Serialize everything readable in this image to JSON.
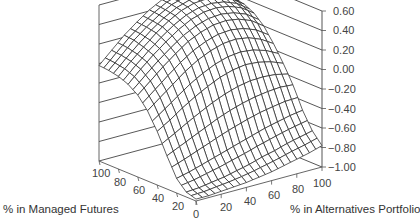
{
  "chart_data": {
    "type": "surface3d",
    "title": "",
    "xlabel": "% in Alternatives Portfolio",
    "ylabel": "% in Managed Futures",
    "zlabel": "",
    "x_ticks": [
      "0",
      "20",
      "40",
      "60",
      "80",
      "100"
    ],
    "y_ticks": [
      "100",
      "80",
      "60",
      "40",
      "20",
      "0"
    ],
    "z_ticks": [
      "0.60",
      "0.40",
      "0.20",
      "0.00",
      "−0.20",
      "−0.40",
      "−0.60",
      "−0.80",
      "−1.00"
    ],
    "zlim": [
      -1.0,
      0.6
    ],
    "x_range": [
      0,
      100
    ],
    "y_range": [
      0,
      100
    ],
    "grid": true,
    "grid_note": "z values at managed futures % (rows, 0..100 step 10) by alternatives % (cols, 0..100 step 10)",
    "mf_values": [
      0,
      10,
      20,
      30,
      40,
      50,
      60,
      70,
      80,
      90,
      100
    ],
    "alt_values": [
      0,
      10,
      20,
      30,
      40,
      50,
      60,
      70,
      80,
      90,
      100
    ],
    "z": [
      [
        -0.98,
        -0.98,
        -0.97,
        -0.96,
        -0.95,
        -0.93,
        -0.91,
        -0.88,
        -0.85,
        -0.82,
        -0.78
      ],
      [
        -0.95,
        -0.94,
        -0.92,
        -0.9,
        -0.87,
        -0.84,
        -0.8,
        -0.77,
        -0.73,
        -0.7,
        -0.67
      ],
      [
        -0.85,
        -0.82,
        -0.78,
        -0.74,
        -0.7,
        -0.66,
        -0.62,
        -0.58,
        -0.55,
        -0.52,
        -0.5
      ],
      [
        -0.66,
        -0.6,
        -0.54,
        -0.48,
        -0.42,
        -0.37,
        -0.33,
        -0.3,
        -0.28,
        -0.27,
        -0.28
      ],
      [
        -0.45,
        -0.37,
        -0.28,
        -0.2,
        -0.13,
        -0.07,
        -0.03,
        -0.01,
        -0.02,
        -0.05,
        -0.1
      ],
      [
        -0.28,
        -0.18,
        -0.08,
        0.02,
        0.1,
        0.16,
        0.2,
        0.21,
        0.19,
        0.14,
        0.06
      ],
      [
        -0.16,
        -0.05,
        0.06,
        0.16,
        0.25,
        0.31,
        0.35,
        0.36,
        0.34,
        0.29,
        0.2
      ],
      [
        -0.09,
        0.03,
        0.14,
        0.24,
        0.33,
        0.4,
        0.44,
        0.45,
        0.43,
        0.38,
        0.29
      ],
      [
        -0.05,
        0.07,
        0.18,
        0.29,
        0.38,
        0.45,
        0.49,
        0.5,
        0.48,
        0.43,
        0.34
      ],
      [
        -0.03,
        0.09,
        0.21,
        0.31,
        0.4,
        0.47,
        0.51,
        0.52,
        0.5,
        0.45,
        0.36
      ],
      [
        -0.02,
        0.1,
        0.22,
        0.32,
        0.41,
        0.48,
        0.52,
        0.53,
        0.51,
        0.46,
        0.37
      ]
    ],
    "colors": {
      "mesh": "#2a2a2a",
      "frame": "#555555",
      "wall_grid": "#444444",
      "background": "#ffffff"
    }
  },
  "labels": {
    "x_axis_title": "% in Alternatives Portfolio",
    "y_axis_title": "% in Managed Futures"
  }
}
